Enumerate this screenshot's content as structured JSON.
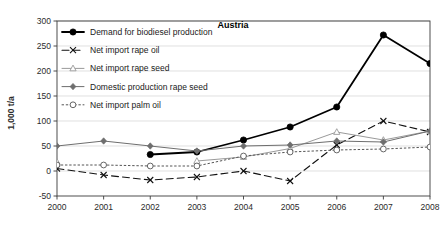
{
  "chart_data": {
    "type": "line",
    "title": "Austria",
    "xlabel": "",
    "ylabel": "1,000 t/a",
    "grid": true,
    "legend_position": "top-left-inside",
    "categories": [
      "2000",
      "2001",
      "2002",
      "2003",
      "2004",
      "2005",
      "2006",
      "2007",
      "2008"
    ],
    "xlim": [
      2000,
      2008
    ],
    "ylim": [
      -50,
      300
    ],
    "yticks": [
      -50,
      0,
      50,
      100,
      150,
      200,
      250,
      300
    ],
    "ytick_labels": [
      "-50",
      "0",
      "50",
      "100",
      "150",
      "200",
      "250",
      "300"
    ],
    "series": [
      {
        "name": "Demand for biodiesel production",
        "marker": "filled-circle",
        "line_style": "solid",
        "color": "#000000",
        "line_width": 1.8,
        "values": [
          null,
          null,
          33,
          38,
          62,
          88,
          128,
          272,
          215
        ]
      },
      {
        "name": "Net import rape oil",
        "marker": "cross-x",
        "line_style": "dashed",
        "color": "#111111",
        "line_width": 1.1,
        "values": [
          5,
          -8,
          -18,
          -12,
          0,
          -20,
          52,
          100,
          78
        ]
      },
      {
        "name": "Net import rape seed",
        "marker": "open-triangle",
        "line_style": "solid-light",
        "color": "#9a9a9a",
        "line_width": 1.0,
        "values": [
          18,
          null,
          null,
          20,
          28,
          45,
          78,
          62,
          80
        ]
      },
      {
        "name": "Domestic production rape seed",
        "marker": "filled-diamond",
        "line_style": "solid-light",
        "color": "#6e6e6e",
        "line_width": 1.0,
        "values": [
          50,
          60,
          50,
          40,
          50,
          52,
          60,
          58,
          80
        ]
      },
      {
        "name": "Net import palm oil",
        "marker": "open-circle",
        "line_style": "dotted",
        "color": "#555555",
        "line_width": 1.0,
        "values": [
          12,
          12,
          10,
          10,
          30,
          38,
          42,
          44,
          48
        ]
      }
    ]
  },
  "legend": {
    "items": [
      {
        "label": "Demand for biodiesel production"
      },
      {
        "label": "Net import rape oil"
      },
      {
        "label": "Net import rape seed"
      },
      {
        "label": "Domestic production rape seed"
      },
      {
        "label": "Net import palm oil"
      }
    ]
  }
}
